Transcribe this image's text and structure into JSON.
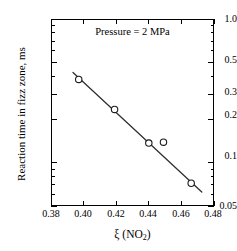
{
  "chart_data": {
    "type": "scatter",
    "title": "",
    "annotation": "Pressure = 2 MPa",
    "xlabel_prefix": "ξ (NO",
    "xlabel_sub": "2",
    "xlabel_suffix": ")",
    "ylabel": "Reaction time in fizz zone, ms",
    "xlim": [
      0.38,
      0.48
    ],
    "ylim": [
      0.05,
      1.0
    ],
    "yscale": "log",
    "xscale": "linear",
    "grid": false,
    "legend": "none",
    "xticks": [
      "0.38",
      "0.40",
      "0.42",
      "0.44",
      "0.46",
      "0.48"
    ],
    "xtick_values": [
      0.38,
      0.4,
      0.42,
      0.44,
      0.46,
      0.48
    ],
    "yticks": [
      "1.0",
      "0.5",
      "0.3",
      "0.2",
      "0.1",
      "0.05"
    ],
    "ytick_values": [
      1.0,
      0.5,
      0.3,
      0.2,
      0.1,
      0.05
    ],
    "marker": "open-circle",
    "series": [
      {
        "name": "Reaction time",
        "x": [
          0.397,
          0.419,
          0.44,
          0.449,
          0.466
        ],
        "y": [
          0.38,
          0.235,
          0.137,
          0.139,
          0.072
        ]
      }
    ],
    "fit_line": {
      "name": "linear fit (log y)",
      "x": [
        0.3935,
        0.4725
      ],
      "y": [
        0.425,
        0.0625
      ]
    },
    "colors": {
      "axis": "#000000",
      "marker_edge": "#1a1a1a",
      "line": "#303030",
      "background": "#ffffff"
    }
  }
}
